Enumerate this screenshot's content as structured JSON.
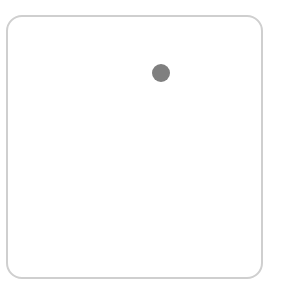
{
  "canvas": {
    "width": 289,
    "height": 285,
    "background": "#ffffff"
  },
  "frame": {
    "shape": "rounded-square",
    "border_color": "#cfcfcf",
    "fill": "#ffffff"
  },
  "marker": {
    "shape": "circle",
    "color": "#7f7f7f",
    "icon": "dot-icon"
  }
}
